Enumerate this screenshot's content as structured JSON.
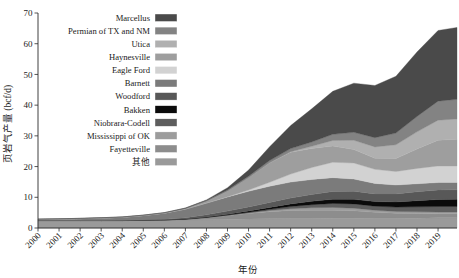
{
  "chart_data": {
    "type": "area",
    "stacked": true,
    "title": "",
    "xlabel": "年份",
    "ylabel": "页岩气产量 (bcf/d)",
    "xlim": [
      2000,
      2019.9
    ],
    "ylim": [
      0,
      70
    ],
    "yticks": [
      0,
      10,
      20,
      30,
      40,
      50,
      60,
      70
    ],
    "ytick_labels": [
      "0",
      "10",
      "20",
      "30",
      "40",
      "50",
      "60",
      "70"
    ],
    "grid": false,
    "legend_position": "upper-left-inside",
    "x": [
      2000,
      2001,
      2002,
      2003,
      2004,
      2005,
      2006,
      2007,
      2008,
      2009,
      2010,
      2011,
      2012,
      2013,
      2014,
      2015,
      2016,
      2017,
      2018,
      2019,
      2019.9
    ],
    "x_tick_labels": [
      "2000",
      "2001",
      "2002",
      "2003",
      "2004",
      "2005",
      "2006",
      "2007",
      "2008",
      "2009",
      "2010",
      "2011",
      "2012",
      "2013",
      "2014",
      "2015",
      "2016",
      "2017",
      "2018",
      "2019"
    ],
    "stack_order_bottom_to_top": [
      "其他",
      "Fayetteville",
      "Mississippi of OK",
      "Niobrara-Codell",
      "Bakken",
      "Woodford",
      "Barnett",
      "Eagle Ford",
      "Haynesville",
      "Utica",
      "Permian of TX and NM",
      "Marcellus"
    ],
    "series": [
      {
        "name": "其他",
        "color": "#9a9a9a",
        "values": [
          2.4,
          2.4,
          2.4,
          2.4,
          2.4,
          2.5,
          2.5,
          2.6,
          2.7,
          2.8,
          2.9,
          3.0,
          3.1,
          3.1,
          3.2,
          3.2,
          3.1,
          3.1,
          3.2,
          3.3,
          3.3
        ]
      },
      {
        "name": "Fayetteville",
        "color": "#8d8d8d",
        "values": [
          0.0,
          0.0,
          0.0,
          0.0,
          0.0,
          0.0,
          0.05,
          0.2,
          0.6,
          1.2,
          1.8,
          2.3,
          2.6,
          2.7,
          2.6,
          2.4,
          2.0,
          1.7,
          1.5,
          1.3,
          1.3
        ]
      },
      {
        "name": "Mississippi of OK",
        "color": "#9c9c9c",
        "values": [
          0.0,
          0.0,
          0.0,
          0.0,
          0.0,
          0.0,
          0.0,
          0.0,
          0.05,
          0.1,
          0.2,
          0.4,
          0.6,
          0.8,
          0.9,
          0.85,
          0.7,
          0.6,
          0.6,
          0.6,
          0.6
        ]
      },
      {
        "name": "Niobrara-Codell",
        "color": "#5e5e5e",
        "values": [
          0.05,
          0.05,
          0.05,
          0.05,
          0.05,
          0.05,
          0.06,
          0.08,
          0.1,
          0.15,
          0.25,
          0.4,
          0.7,
          1.0,
          1.3,
          1.4,
          1.3,
          1.4,
          1.6,
          1.8,
          1.8
        ]
      },
      {
        "name": "Bakken",
        "color": "#0b0b0b",
        "values": [
          0.0,
          0.0,
          0.0,
          0.0,
          0.0,
          0.02,
          0.04,
          0.08,
          0.15,
          0.25,
          0.4,
          0.6,
          0.85,
          1.1,
          1.4,
          1.5,
          1.5,
          1.7,
          2.0,
          2.3,
          2.35
        ]
      },
      {
        "name": "Woodford",
        "color": "#585858",
        "values": [
          0.0,
          0.0,
          0.0,
          0.0,
          0.05,
          0.1,
          0.2,
          0.4,
          0.7,
          1.0,
          1.3,
          1.6,
          1.9,
          2.2,
          2.5,
          2.6,
          2.5,
          2.6,
          2.9,
          3.1,
          3.1
        ]
      },
      {
        "name": "Barnett",
        "color": "#7b7b7b",
        "values": [
          0.35,
          0.45,
          0.6,
          0.8,
          1.0,
          1.4,
          2.0,
          2.8,
          3.8,
          4.6,
          5.1,
          5.3,
          5.2,
          4.9,
          4.5,
          4.0,
          3.4,
          2.9,
          2.6,
          2.4,
          2.35
        ]
      },
      {
        "name": "Eagle Ford",
        "color": "#d2d2d2",
        "values": [
          0.0,
          0.0,
          0.0,
          0.0,
          0.0,
          0.0,
          0.0,
          0.0,
          0.05,
          0.1,
          0.4,
          1.3,
          2.6,
          3.9,
          5.0,
          5.2,
          4.6,
          4.4,
          5.0,
          5.4,
          5.4
        ]
      },
      {
        "name": "Haynesville",
        "color": "#9e9e9e",
        "values": [
          0.0,
          0.0,
          0.0,
          0.0,
          0.0,
          0.0,
          0.0,
          0.1,
          0.5,
          1.8,
          4.0,
          6.3,
          7.1,
          6.2,
          5.3,
          4.4,
          3.6,
          4.2,
          6.3,
          8.4,
          8.7
        ]
      },
      {
        "name": "Utica",
        "color": "#b0b0b0",
        "values": [
          0.0,
          0.0,
          0.0,
          0.0,
          0.0,
          0.0,
          0.0,
          0.0,
          0.0,
          0.0,
          0.0,
          0.05,
          0.2,
          0.7,
          1.8,
          3.0,
          3.7,
          4.5,
          5.6,
          6.5,
          6.6
        ]
      },
      {
        "name": "Permian of TX and NM",
        "color": "#838383",
        "values": [
          0.1,
          0.1,
          0.1,
          0.1,
          0.1,
          0.12,
          0.15,
          0.2,
          0.3,
          0.4,
          0.5,
          0.7,
          1.0,
          1.4,
          2.0,
          2.6,
          3.0,
          3.8,
          5.0,
          6.2,
          6.4
        ]
      },
      {
        "name": "Marcellus",
        "color": "#4a4a4a",
        "values": [
          0.0,
          0.0,
          0.0,
          0.0,
          0.0,
          0.0,
          0.0,
          0.05,
          0.2,
          0.7,
          2.0,
          4.5,
          7.5,
          10.8,
          14.0,
          16.0,
          17.0,
          18.5,
          21.0,
          23.0,
          23.4
        ]
      }
    ]
  },
  "legend": {
    "items": [
      {
        "label": "Marcellus",
        "color": "#4a4a4a"
      },
      {
        "label": "Permian of TX and NM",
        "color": "#838383"
      },
      {
        "label": "Utica",
        "color": "#b0b0b0"
      },
      {
        "label": "Haynesville",
        "color": "#9e9e9e"
      },
      {
        "label": "Eagle Ford",
        "color": "#d2d2d2"
      },
      {
        "label": "Barnett",
        "color": "#7b7b7b"
      },
      {
        "label": "Woodford",
        "color": "#585858"
      },
      {
        "label": "Bakken",
        "color": "#0b0b0b"
      },
      {
        "label": "Niobrara-Codell",
        "color": "#5e5e5e"
      },
      {
        "label": "Mississippi of OK",
        "color": "#9c9c9c"
      },
      {
        "label": "Fayetteville",
        "color": "#8d8d8d"
      },
      {
        "label": "其他",
        "color": "#9a9a9a"
      }
    ]
  },
  "axes": {
    "y_title": "页岩气产量 (bcf/d)",
    "x_title": "年份"
  }
}
